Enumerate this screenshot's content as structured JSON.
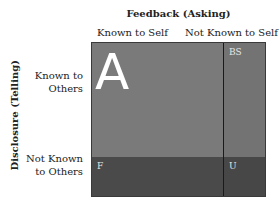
{
  "title": "Feedback (Asking)",
  "columns": [
    "Known to Self",
    "Not Known to Self"
  ],
  "y_axis_label": "Disclosure (Telling)",
  "rows": [
    "Known to Others",
    "Not Known to Others"
  ],
  "row_lines": [
    [
      "Known to",
      "Others"
    ],
    [
      "Not Known",
      "to Others"
    ]
  ],
  "quadrants": {
    "open": {
      "label": "A",
      "color": "#7a7a7a"
    },
    "blind_spot": {
      "label": "BS",
      "color": "#737373"
    },
    "facade": {
      "label": "F",
      "color": "#4a4a4a"
    },
    "unknown": {
      "label": "U",
      "color": "#474747"
    }
  }
}
